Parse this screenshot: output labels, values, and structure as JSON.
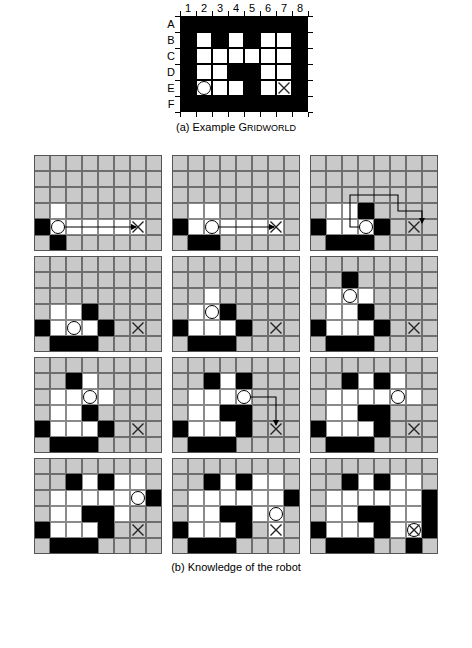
{
  "figure": {
    "panel_a": {
      "caption_prefix": "(a) Example ",
      "caption_g": "G",
      "caption_rest": "RIDWORLD",
      "col_labels": [
        "1",
        "2",
        "3",
        "4",
        "5",
        "6",
        "7",
        "8"
      ],
      "row_labels": [
        "A",
        "B",
        "C",
        "D",
        "E",
        "F"
      ],
      "legend": {
        "wall": "#000000",
        "free": "#ffffff",
        "unknown": "#c9c9c9"
      },
      "rows": 6,
      "cols": 8,
      "grid": [
        [
          "wall",
          "wall",
          "wall",
          "wall",
          "wall",
          "wall",
          "wall",
          "wall"
        ],
        [
          "wall",
          "free",
          "wall",
          "free",
          "wall",
          "free",
          "free",
          "wall"
        ],
        [
          "wall",
          "free",
          "free",
          "free",
          "free",
          "free",
          "free",
          "wall"
        ],
        [
          "wall",
          "free",
          "free",
          "wall",
          "wall",
          "free",
          "free",
          "wall"
        ],
        [
          "wall",
          "free",
          "free",
          "free",
          "wall",
          "free",
          "free",
          "wall"
        ],
        [
          "wall",
          "wall",
          "wall",
          "wall",
          "wall",
          "wall",
          "wall",
          "wall"
        ]
      ],
      "robot": {
        "row": 4,
        "col": 1,
        "label": "E2"
      },
      "goal": {
        "row": 4,
        "col": 6,
        "label": "E7"
      }
    },
    "panel_b": {
      "caption": "(b) Knowledge of the robot",
      "rows": 6,
      "cols": 8,
      "panels": [
        {
          "index": 1,
          "grid": [
            [
              "unk",
              "unk",
              "unk",
              "unk",
              "unk",
              "unk",
              "unk",
              "unk"
            ],
            [
              "unk",
              "unk",
              "unk",
              "unk",
              "unk",
              "unk",
              "unk",
              "unk"
            ],
            [
              "unk",
              "unk",
              "unk",
              "unk",
              "unk",
              "unk",
              "unk",
              "unk"
            ],
            [
              "unk",
              "free",
              "unk",
              "unk",
              "unk",
              "unk",
              "unk",
              "unk"
            ],
            [
              "wall",
              "free",
              "free",
              "free",
              "free",
              "free",
              "free",
              "unk"
            ],
            [
              "unk",
              "wall",
              "unk",
              "unk",
              "unk",
              "unk",
              "unk",
              "unk"
            ]
          ],
          "robot": {
            "row": 4,
            "col": 1
          },
          "goal": {
            "row": 4,
            "col": 6
          },
          "path": "M 24,72 L 102,72"
        },
        {
          "index": 2,
          "grid": [
            [
              "unk",
              "unk",
              "unk",
              "unk",
              "unk",
              "unk",
              "unk",
              "unk"
            ],
            [
              "unk",
              "unk",
              "unk",
              "unk",
              "unk",
              "unk",
              "unk",
              "unk"
            ],
            [
              "unk",
              "unk",
              "unk",
              "unk",
              "unk",
              "unk",
              "unk",
              "unk"
            ],
            [
              "unk",
              "free",
              "free",
              "unk",
              "unk",
              "unk",
              "unk",
              "unk"
            ],
            [
              "wall",
              "free",
              "free",
              "free",
              "free",
              "free",
              "free",
              "unk"
            ],
            [
              "unk",
              "wall",
              "wall",
              "unk",
              "unk",
              "unk",
              "unk",
              "unk"
            ]
          ],
          "robot": {
            "row": 4,
            "col": 2
          },
          "goal": {
            "row": 4,
            "col": 6
          },
          "path": "M 40,72 L 102,72"
        },
        {
          "index": 3,
          "grid": [
            [
              "unk",
              "unk",
              "unk",
              "unk",
              "unk",
              "unk",
              "unk",
              "unk"
            ],
            [
              "unk",
              "unk",
              "unk",
              "unk",
              "unk",
              "unk",
              "unk",
              "unk"
            ],
            [
              "unk",
              "unk",
              "unk",
              "unk",
              "unk",
              "unk",
              "unk",
              "unk"
            ],
            [
              "unk",
              "free",
              "free",
              "wall",
              "unk",
              "unk",
              "unk",
              "unk"
            ],
            [
              "wall",
              "free",
              "free",
              "free",
              "wall",
              "unk",
              "unk",
              "unk"
            ],
            [
              "unk",
              "wall",
              "wall",
              "wall",
              "unk",
              "unk",
              "unk",
              "unk"
            ]
          ],
          "robot": {
            "row": 4,
            "col": 3
          },
          "goal": {
            "row": 4,
            "col": 6
          },
          "path": "M 56,72 L 40,72 L 40,40 L 88,40 L 88,56 L 112,56 L 112,68"
        },
        {
          "index": 4,
          "grid": [
            [
              "unk",
              "unk",
              "unk",
              "unk",
              "unk",
              "unk",
              "unk",
              "unk"
            ],
            [
              "unk",
              "unk",
              "unk",
              "unk",
              "unk",
              "unk",
              "unk",
              "unk"
            ],
            [
              "unk",
              "unk",
              "unk",
              "unk",
              "unk",
              "unk",
              "unk",
              "unk"
            ],
            [
              "unk",
              "free",
              "free",
              "wall",
              "unk",
              "unk",
              "unk",
              "unk"
            ],
            [
              "wall",
              "free",
              "free",
              "free",
              "wall",
              "unk",
              "unk",
              "unk"
            ],
            [
              "unk",
              "wall",
              "wall",
              "wall",
              "unk",
              "unk",
              "unk",
              "unk"
            ]
          ],
          "robot": {
            "row": 4,
            "col": 2
          },
          "goal": {
            "row": 4,
            "col": 6
          },
          "path": ""
        },
        {
          "index": 5,
          "grid": [
            [
              "unk",
              "unk",
              "unk",
              "unk",
              "unk",
              "unk",
              "unk",
              "unk"
            ],
            [
              "unk",
              "unk",
              "unk",
              "unk",
              "unk",
              "unk",
              "unk",
              "unk"
            ],
            [
              "unk",
              "unk",
              "free",
              "unk",
              "unk",
              "unk",
              "unk",
              "unk"
            ],
            [
              "unk",
              "free",
              "free",
              "wall",
              "unk",
              "unk",
              "unk",
              "unk"
            ],
            [
              "wall",
              "free",
              "free",
              "free",
              "wall",
              "unk",
              "unk",
              "unk"
            ],
            [
              "unk",
              "wall",
              "wall",
              "wall",
              "unk",
              "unk",
              "unk",
              "unk"
            ]
          ],
          "robot": {
            "row": 3,
            "col": 2
          },
          "goal": {
            "row": 4,
            "col": 6
          },
          "path": ""
        },
        {
          "index": 6,
          "grid": [
            [
              "unk",
              "unk",
              "unk",
              "unk",
              "unk",
              "unk",
              "unk",
              "unk"
            ],
            [
              "unk",
              "unk",
              "wall",
              "unk",
              "unk",
              "unk",
              "unk",
              "unk"
            ],
            [
              "unk",
              "free",
              "free",
              "free",
              "unk",
              "unk",
              "unk",
              "unk"
            ],
            [
              "unk",
              "free",
              "free",
              "wall",
              "unk",
              "unk",
              "unk",
              "unk"
            ],
            [
              "wall",
              "free",
              "free",
              "free",
              "wall",
              "unk",
              "unk",
              "unk"
            ],
            [
              "unk",
              "wall",
              "wall",
              "wall",
              "unk",
              "unk",
              "unk",
              "unk"
            ]
          ],
          "robot": {
            "row": 2,
            "col": 2
          },
          "goal": {
            "row": 4,
            "col": 6
          },
          "path": ""
        },
        {
          "index": 7,
          "grid": [
            [
              "unk",
              "unk",
              "unk",
              "unk",
              "unk",
              "unk",
              "unk",
              "unk"
            ],
            [
              "unk",
              "unk",
              "wall",
              "free",
              "unk",
              "unk",
              "unk",
              "unk"
            ],
            [
              "unk",
              "free",
              "free",
              "free",
              "free",
              "unk",
              "unk",
              "unk"
            ],
            [
              "unk",
              "free",
              "free",
              "wall",
              "unk",
              "unk",
              "unk",
              "unk"
            ],
            [
              "wall",
              "free",
              "free",
              "free",
              "wall",
              "unk",
              "unk",
              "unk"
            ],
            [
              "unk",
              "wall",
              "wall",
              "wall",
              "unk",
              "unk",
              "unk",
              "unk"
            ]
          ],
          "robot": {
            "row": 2,
            "col": 3
          },
          "goal": {
            "row": 4,
            "col": 6
          },
          "path": ""
        },
        {
          "index": 8,
          "grid": [
            [
              "unk",
              "unk",
              "unk",
              "unk",
              "unk",
              "unk",
              "unk",
              "unk"
            ],
            [
              "unk",
              "unk",
              "wall",
              "free",
              "wall",
              "unk",
              "unk",
              "unk"
            ],
            [
              "unk",
              "free",
              "free",
              "free",
              "free",
              "unk",
              "unk",
              "unk"
            ],
            [
              "unk",
              "free",
              "free",
              "wall",
              "wall",
              "unk",
              "unk",
              "unk"
            ],
            [
              "wall",
              "free",
              "free",
              "free",
              "wall",
              "unk",
              "unk",
              "unk"
            ],
            [
              "unk",
              "wall",
              "wall",
              "wall",
              "unk",
              "unk",
              "unk",
              "unk"
            ]
          ],
          "robot": {
            "row": 2,
            "col": 4
          },
          "goal": {
            "row": 4,
            "col": 6
          },
          "path": "M 72,40 L 104,40 L 104,68"
        },
        {
          "index": 9,
          "grid": [
            [
              "unk",
              "unk",
              "unk",
              "unk",
              "unk",
              "unk",
              "unk",
              "unk"
            ],
            [
              "unk",
              "unk",
              "wall",
              "free",
              "wall",
              "free",
              "unk",
              "unk"
            ],
            [
              "unk",
              "free",
              "free",
              "free",
              "free",
              "free",
              "free",
              "unk"
            ],
            [
              "unk",
              "free",
              "free",
              "wall",
              "wall",
              "unk",
              "unk",
              "unk"
            ],
            [
              "wall",
              "free",
              "free",
              "free",
              "wall",
              "unk",
              "unk",
              "unk"
            ],
            [
              "unk",
              "wall",
              "wall",
              "wall",
              "unk",
              "unk",
              "unk",
              "unk"
            ]
          ],
          "robot": {
            "row": 2,
            "col": 5
          },
          "goal": {
            "row": 4,
            "col": 6
          },
          "path": ""
        },
        {
          "index": 10,
          "grid": [
            [
              "unk",
              "unk",
              "unk",
              "unk",
              "unk",
              "unk",
              "unk",
              "unk"
            ],
            [
              "unk",
              "unk",
              "wall",
              "free",
              "wall",
              "free",
              "free",
              "unk"
            ],
            [
              "unk",
              "free",
              "free",
              "free",
              "free",
              "free",
              "free",
              "wall"
            ],
            [
              "unk",
              "free",
              "free",
              "wall",
              "wall",
              "free",
              "unk",
              "unk"
            ],
            [
              "wall",
              "free",
              "free",
              "free",
              "wall",
              "unk",
              "unk",
              "unk"
            ],
            [
              "unk",
              "wall",
              "wall",
              "wall",
              "unk",
              "unk",
              "unk",
              "unk"
            ]
          ],
          "robot": {
            "row": 2,
            "col": 6
          },
          "goal": {
            "row": 4,
            "col": 6
          },
          "path": ""
        },
        {
          "index": 11,
          "grid": [
            [
              "unk",
              "unk",
              "unk",
              "unk",
              "unk",
              "unk",
              "unk",
              "unk"
            ],
            [
              "unk",
              "unk",
              "wall",
              "free",
              "wall",
              "free",
              "free",
              "unk"
            ],
            [
              "unk",
              "free",
              "free",
              "free",
              "free",
              "free",
              "free",
              "wall"
            ],
            [
              "unk",
              "free",
              "free",
              "wall",
              "wall",
              "free",
              "free",
              "unk"
            ],
            [
              "wall",
              "free",
              "free",
              "free",
              "wall",
              "unk",
              "free",
              "unk"
            ],
            [
              "unk",
              "wall",
              "wall",
              "wall",
              "unk",
              "unk",
              "unk",
              "unk"
            ]
          ],
          "robot": {
            "row": 3,
            "col": 6
          },
          "goal": {
            "row": 4,
            "col": 6
          },
          "path": ""
        },
        {
          "index": 12,
          "grid": [
            [
              "unk",
              "unk",
              "unk",
              "unk",
              "unk",
              "unk",
              "unk",
              "unk"
            ],
            [
              "unk",
              "unk",
              "wall",
              "free",
              "wall",
              "free",
              "free",
              "unk"
            ],
            [
              "unk",
              "free",
              "free",
              "free",
              "free",
              "free",
              "free",
              "wall"
            ],
            [
              "unk",
              "free",
              "free",
              "wall",
              "wall",
              "free",
              "free",
              "wall"
            ],
            [
              "wall",
              "free",
              "free",
              "free",
              "wall",
              "free",
              "free",
              "wall"
            ],
            [
              "unk",
              "wall",
              "wall",
              "wall",
              "unk",
              "unk",
              "wall",
              "unk"
            ]
          ],
          "robot": {
            "row": 4,
            "col": 6
          },
          "goal": {
            "row": 4,
            "col": 6
          },
          "path": ""
        }
      ]
    }
  }
}
